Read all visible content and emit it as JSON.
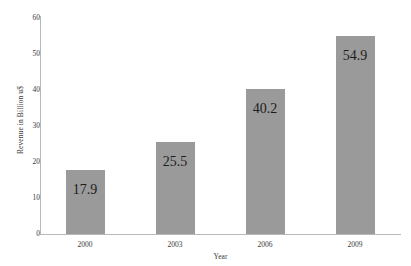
{
  "chart_data": {
    "type": "bar",
    "title": "",
    "subtitle": "",
    "xlabel": "Year",
    "ylabel": "Revenue in Billion u$",
    "categories": [
      "2000",
      "2003",
      "2006",
      "2009"
    ],
    "values": [
      17.9,
      25.5,
      40.2,
      54.9
    ],
    "value_labels": [
      "17.9",
      "25.5",
      "40.2",
      "54.9"
    ],
    "ylim": [
      0,
      60
    ],
    "ytick_labels": [
      "0",
      "10",
      "20",
      "30",
      "40",
      "50",
      "60"
    ],
    "ytick_values": [
      0,
      10,
      20,
      30,
      40,
      50,
      60
    ],
    "grid": false,
    "legend": null,
    "bar_color": "#9a9a9a",
    "axis_color": "#b9b9b9",
    "text_color": "#3a3a3a",
    "value_label_color": "#1d1d1d",
    "background_color": "#ffffff"
  }
}
